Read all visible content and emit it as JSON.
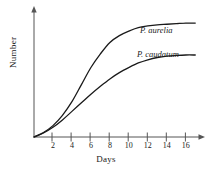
{
  "chart_data": {
    "type": "line",
    "title": "",
    "xlabel": "Days",
    "ylabel": "Number",
    "xlim": [
      0,
      17.5
    ],
    "ylim": [
      0,
      1.08
    ],
    "grid": false,
    "legend_position": "inline-right",
    "xticks": [
      2,
      4,
      6,
      8,
      10,
      12,
      14,
      16
    ],
    "xtick_labels": [
      "2",
      "4",
      "6",
      "8",
      "10",
      "12",
      "14",
      "16"
    ],
    "yticks": [],
    "ytick_labels": [],
    "axis_style": "arrow-ended",
    "line_color": "#1a1a1a",
    "background_color": "#ffffff",
    "x": [
      0,
      1,
      2,
      3,
      4,
      5,
      6,
      7,
      8,
      9,
      10,
      11,
      12,
      13,
      14,
      15,
      16,
      17
    ],
    "series": [
      {
        "name": "P. aurelia",
        "label": "P. aurelia",
        "carrying_capacity": 1.0,
        "values": [
          0,
          0.04,
          0.1,
          0.19,
          0.31,
          0.46,
          0.61,
          0.73,
          0.83,
          0.89,
          0.93,
          0.96,
          0.975,
          0.985,
          0.99,
          0.995,
          1.0,
          1.0
        ]
      },
      {
        "name": "P. caudatum",
        "label": "P. caudatum",
        "carrying_capacity": 0.72,
        "values": [
          0,
          0.035,
          0.085,
          0.15,
          0.225,
          0.3,
          0.375,
          0.445,
          0.51,
          0.565,
          0.61,
          0.65,
          0.678,
          0.698,
          0.71,
          0.716,
          0.72,
          0.72
        ]
      }
    ]
  },
  "labels": {
    "x_axis_title": "Days",
    "y_axis_title": "Number"
  }
}
